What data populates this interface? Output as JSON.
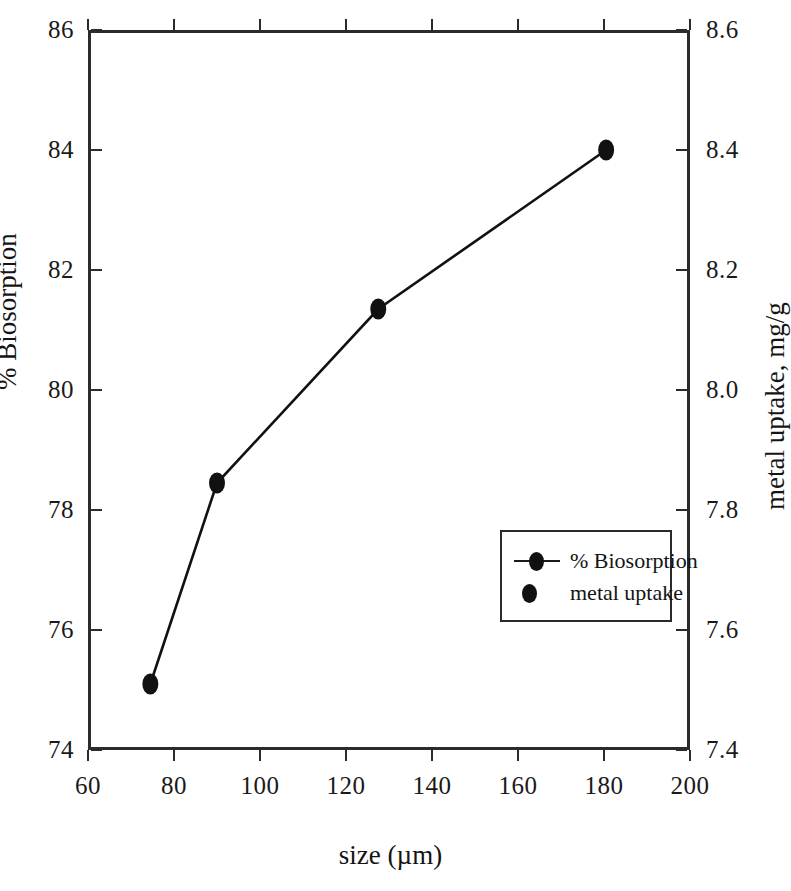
{
  "chart_data": {
    "type": "line",
    "title": "",
    "xlabel": "size (µm)",
    "ylabel": "% Biosorption",
    "ylabel_right": "metal uptake, mg/g",
    "xlim": [
      60,
      200
    ],
    "ylim": [
      74,
      86
    ],
    "ylim_right": [
      7.4,
      8.6
    ],
    "grid": false,
    "legend_position": "center-right",
    "xticks": [
      60,
      80,
      100,
      120,
      140,
      160,
      180,
      200
    ],
    "xticklabels": [
      "60",
      "80",
      "100",
      "120",
      "140",
      "160",
      "180",
      "200"
    ],
    "yticks": [
      74,
      76,
      78,
      80,
      82,
      84,
      86
    ],
    "yticklabels": [
      "74",
      "76",
      "78",
      "80",
      "82",
      "84",
      "86"
    ],
    "yticks_right": [
      7.4,
      7.6,
      7.8,
      8.0,
      8.2,
      8.4,
      8.6
    ],
    "yticklabels_right": [
      "7.4",
      "7.6",
      "7.8",
      "8.0",
      "8.2",
      "8.4",
      "8.6"
    ],
    "x": [
      74.5,
      90,
      127.5,
      180.5
    ],
    "series": [
      {
        "name": "% Biosorption",
        "axis": "left",
        "marker": "circle",
        "line": "solid",
        "color": "#111111",
        "values": [
          75.1,
          78.45,
          81.35,
          84.0
        ]
      },
      {
        "name": "metal uptake",
        "axis": "right",
        "marker": "circle",
        "line": "none",
        "color": "#111111",
        "values": [
          7.51,
          7.845,
          8.135,
          8.4
        ]
      }
    ],
    "legend": [
      {
        "label": "% Biosorption",
        "key": "line-with-marker"
      },
      {
        "label": "metal uptake",
        "key": "marker-only"
      }
    ]
  },
  "axes": {
    "left": {
      "title": "% Biosorption",
      "labels": [
        "86",
        "84",
        "82",
        "80",
        "78",
        "76",
        "74"
      ]
    },
    "right": {
      "title": "metal uptake, mg/g",
      "labels": [
        "8.6",
        "8.4",
        "8.2",
        "8.0",
        "7.8",
        "7.6",
        "7.4"
      ]
    },
    "bottom": {
      "title": "size (µm)",
      "labels": [
        "60",
        "80",
        "100",
        "120",
        "140",
        "160",
        "180",
        "200"
      ]
    }
  },
  "legend": {
    "items": [
      {
        "label": "% Biosorption"
      },
      {
        "label": "metal uptake"
      }
    ]
  },
  "colors": {
    "axis": "#2b2b2b",
    "data": "#111111",
    "text": "#141414",
    "background": "#ffffff"
  }
}
